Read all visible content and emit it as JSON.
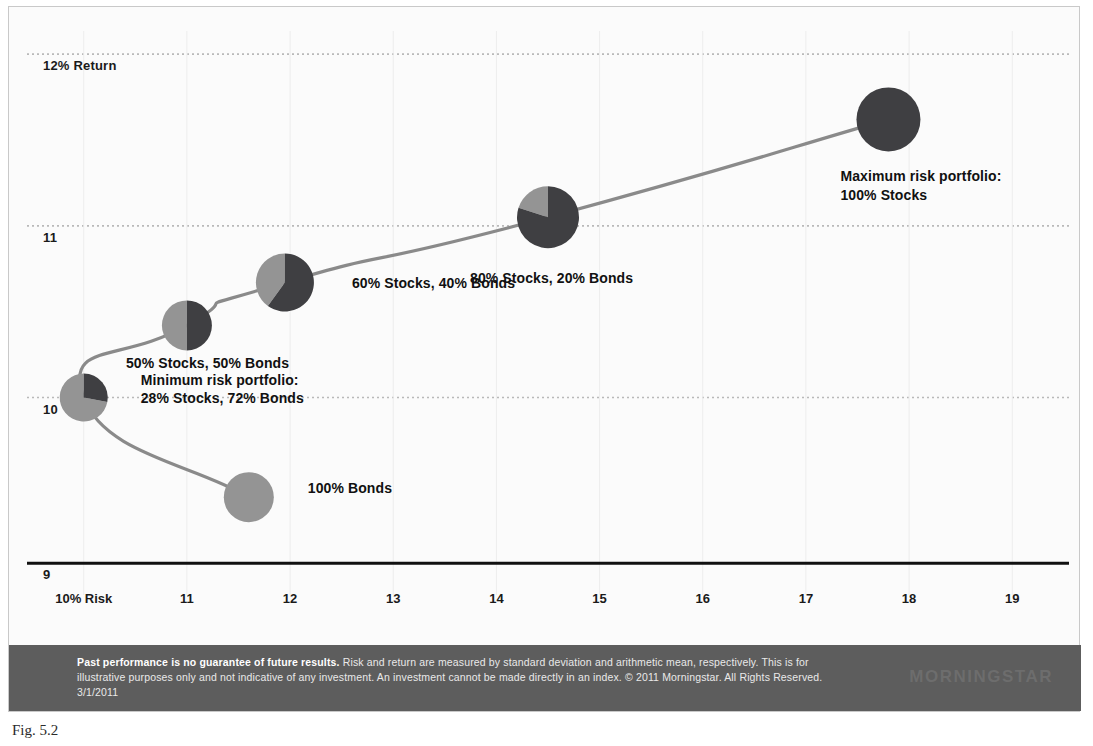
{
  "figure": {
    "caption": "Fig. 5.2"
  },
  "chart_data": {
    "type": "scatter",
    "title": "",
    "xlabel": "Risk",
    "ylabel": "Return",
    "grid": true,
    "legend_position": "none",
    "x_ticks": [
      "10% Risk",
      "11",
      "12",
      "13",
      "14",
      "15",
      "16",
      "17",
      "18",
      "19"
    ],
    "x_tick_values": [
      10,
      11,
      12,
      13,
      14,
      15,
      16,
      17,
      18,
      19
    ],
    "y_ticks": [
      "12% Return",
      "11",
      "10",
      "9"
    ],
    "y_tick_values": [
      12,
      11,
      10,
      9
    ],
    "xlim": [
      9.45,
      19.55
    ],
    "ylim": [
      8.85,
      12.1
    ],
    "series_name": "Efficient frontier",
    "colors": {
      "stocks": "#3f3f42",
      "bonds": "#949494",
      "curve": "#8a8a8a",
      "gridline": "#b9b9b9",
      "axis": "#111111",
      "background": "#fbfbfb"
    },
    "points": [
      {
        "id": "bonds-100",
        "label": "100% Bonds",
        "stocks_pct": 0,
        "bonds_pct": 100,
        "risk": 11.6,
        "return": 9.42,
        "marker_radius": 25,
        "label_dx": 34,
        "label_dy": -9
      },
      {
        "id": "minimum-risk",
        "label_line1": "Minimum risk portfolio:",
        "label_line2": "28% Stocks, 72% Bonds",
        "stocks_pct": 28,
        "bonds_pct": 72,
        "risk": 10.0,
        "return": 10.0,
        "marker_radius": 24,
        "label_dx": 33,
        "label_dy": -18
      },
      {
        "id": "stocks-50",
        "label": "50% Stocks, 50% Bonds",
        "stocks_pct": 50,
        "bonds_pct": 50,
        "risk": 11.0,
        "return": 10.42,
        "marker_radius": 25,
        "label_dx": -36,
        "label_dy": 38
      },
      {
        "id": "stocks-60",
        "label": "60% Stocks, 40% Bonds",
        "stocks_pct": 60,
        "bonds_pct": 40,
        "risk": 11.95,
        "return": 10.67,
        "marker_radius": 29,
        "label_dx": 38,
        "label_dy": 0
      },
      {
        "id": "stocks-80",
        "label": "80% Stocks, 20% Bonds",
        "stocks_pct": 80,
        "bonds_pct": 20,
        "risk": 14.5,
        "return": 11.05,
        "marker_radius": 31,
        "label_dx": 0,
        "label_dy": 52
      },
      {
        "id": "maximum-risk",
        "label_line1": "Maximum risk portfolio:",
        "label_line2": "100% Stocks",
        "stocks_pct": 100,
        "bonds_pct": 0,
        "risk": 17.8,
        "return": 11.62,
        "marker_radius": 32,
        "label_dx": -48,
        "label_dy": 48
      }
    ]
  },
  "footer": {
    "bold_lead": "Past performance is no guarantee of future results.",
    "body": " Risk and return are measured by standard deviation and arithmetic mean, respectively. This is for illustrative purposes only and not indicative of any investment. An investment cannot be made directly in an index. © 2011 Morningstar. All Rights Reserved. 3/1/2011",
    "logo": "MORNINGSTAR"
  }
}
